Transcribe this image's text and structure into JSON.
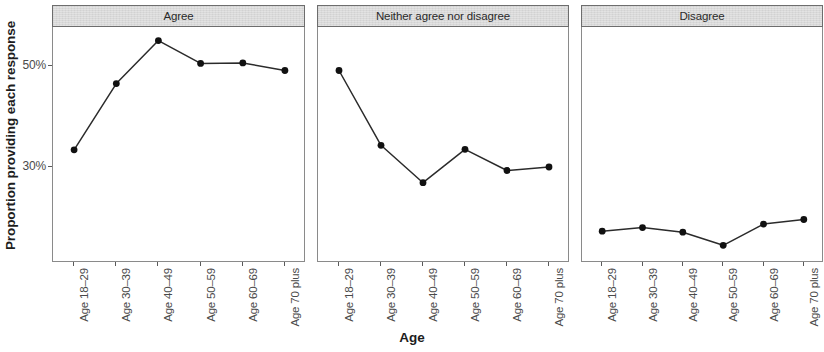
{
  "chart_data": {
    "type": "line",
    "title": "",
    "xlabel": "Age",
    "ylabel": "Proportion providing each response",
    "categories": [
      "Age 18–29",
      "Age 30–39",
      "Age 40–49",
      "Age 50–59",
      "Age 60–69",
      "Age 70 plus"
    ],
    "ylim": [
      0.11,
      0.575
    ],
    "ytick_values": [
      0.3,
      0.5
    ],
    "ytick_labels": [
      "30%",
      "50%"
    ],
    "grid": false,
    "legend": "none",
    "facet_layout": "1 row x 3 columns",
    "point_color": "#111111",
    "line_color": "#2b2b2b",
    "strip_fill": "#d9d9d9",
    "panels": [
      {
        "label": "Agree",
        "series": [
          {
            "name": "Agree",
            "values": [
              0.332,
              0.463,
              0.548,
              0.503,
              0.504,
              0.489
            ]
          }
        ]
      },
      {
        "label": "Neither agree nor disagree",
        "series": [
          {
            "name": "Neither agree nor disagree",
            "values": [
              0.489,
              0.341,
              0.267,
              0.333,
              0.291,
              0.298
            ]
          }
        ]
      },
      {
        "label": "Disagree",
        "series": [
          {
            "name": "Disagree",
            "values": [
              0.171,
              0.178,
              0.169,
              0.143,
              0.185,
              0.194
            ]
          }
        ]
      }
    ]
  }
}
